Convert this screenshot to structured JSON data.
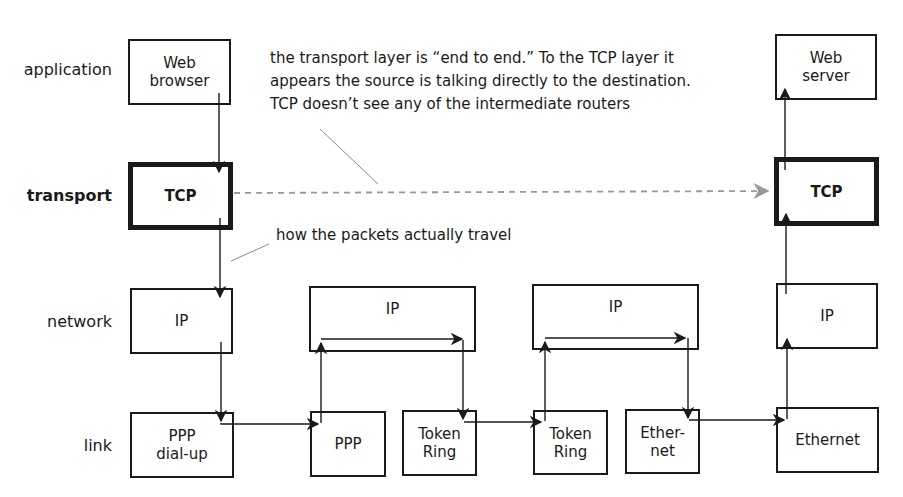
{
  "layers": {
    "application": "application",
    "transport": "transport",
    "network": "network",
    "link": "link"
  },
  "source_host": {
    "application": "Web\nbrowser",
    "transport": "TCP",
    "network": "IP",
    "link": "PPP\ndial-up"
  },
  "router_1": {
    "network": "IP",
    "link_in": "PPP",
    "link_out": "Token\nRing"
  },
  "router_2": {
    "network": "IP",
    "link_in": "Token\nRing",
    "link_out": "Ether-\nnet"
  },
  "destination_host": {
    "application": "Web\nserver",
    "transport": "TCP",
    "network": "IP",
    "link": "Ethernet"
  },
  "annotations": {
    "end_to_end": "the transport layer is “end to end.” To the TCP layer it\nappears the source is talking directly to the destination.\nTCP doesn’t see any of the intermediate routers",
    "actual_path": "how the packets actually travel"
  },
  "colors": {
    "line": "#1a1a1a",
    "dashed_logical_link": "#999999",
    "pointer_line": "#8a8a8a"
  }
}
